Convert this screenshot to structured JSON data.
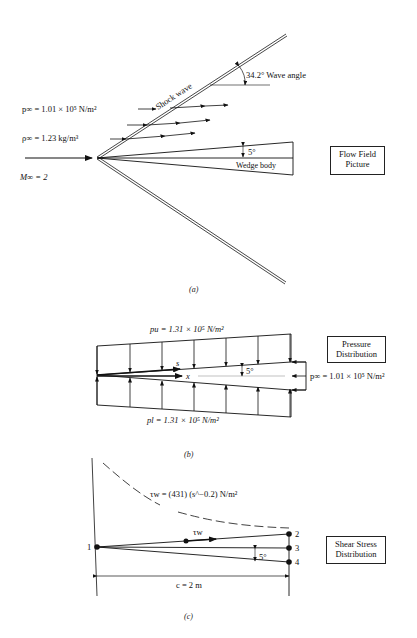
{
  "panel_a": {
    "caption": "(a)",
    "box_title_line1": "Flow Field",
    "box_title_line2": "Picture",
    "p_inf": "p∞ = 1.01 × 10⁵ N/m²",
    "rho_inf": "ρ∞ = 1.23 kg/m³",
    "mach": "M∞ = 2",
    "shock_label": "Shock wave",
    "wave_angle": "34.2° Wave angle",
    "half_angle": "5°",
    "body_label": "Wedge body"
  },
  "panel_b": {
    "caption": "(b)",
    "box_title_line1": "Pressure",
    "box_title_line2": "Distribution",
    "p_upper": "pu = 1.31 × 10⁵ N/m²",
    "p_lower": "pl = 1.31 × 10⁵ N/m²",
    "p_base": "p∞ = 1.01 × 10⁵ N/m²",
    "s_label": "s",
    "x_label": "x",
    "half_angle": "5°"
  },
  "panel_c": {
    "caption": "(c)",
    "box_title_line1": "Shear Stress",
    "box_title_line2": "Distribution",
    "tau_formula": "τw = (431) (s^−0.2) N/m²",
    "tau_label": "τw",
    "half_angle": "5°",
    "chord": "c = 2 m",
    "points": [
      "1",
      "2",
      "3",
      "4"
    ]
  }
}
